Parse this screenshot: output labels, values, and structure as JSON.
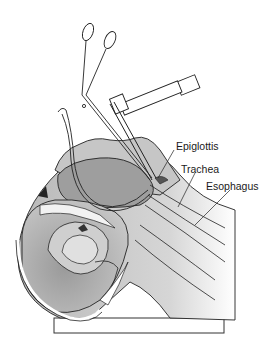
{
  "diagram": {
    "type": "anatomical-illustration",
    "labels": [
      {
        "id": "epiglottis",
        "text": "Epiglottis"
      },
      {
        "id": "trachea",
        "text": "Trachea"
      },
      {
        "id": "esophagus",
        "text": "Esophagus"
      }
    ],
    "colors": {
      "outline": "#222222",
      "tissue_light": "#d4d4d4",
      "tissue_mid": "#a8a8a8",
      "tissue_dark": "#7a7a7a",
      "cavity_white": "#f4f4f4",
      "background": "#ffffff"
    }
  }
}
